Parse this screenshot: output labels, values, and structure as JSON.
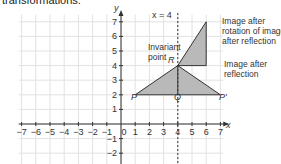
{
  "caption": "transformations.",
  "chart_data": {
    "type": "diagram",
    "title": "",
    "xlabel": "x",
    "ylabel": "y",
    "xlim": [
      -7,
      7
    ],
    "ylim": [
      -3,
      7
    ],
    "x_ticks": [
      "-7",
      "-6",
      "-5",
      "-4",
      "-3",
      "-2",
      "-1",
      "0",
      "1",
      "2",
      "3",
      "4",
      "5",
      "6",
      "7"
    ],
    "y_ticks": [
      "-2",
      "-1",
      "1",
      "2",
      "3",
      "4",
      "5",
      "6",
      "7"
    ],
    "mirror_line": {
      "label": "x = 4",
      "x": 4
    },
    "shapes": [
      {
        "name": "Image after reflection",
        "points": [
          [
            1,
            2
          ],
          [
            4,
            4
          ],
          [
            7,
            2
          ]
        ],
        "note": "triangle PRP' split by QR"
      },
      {
        "name": "Image after rotation of image after reflection",
        "points": [
          [
            4,
            4
          ],
          [
            6,
            7
          ],
          [
            6,
            4
          ]
        ]
      }
    ],
    "points": {
      "P": [
        1,
        2
      ],
      "Q": [
        4,
        2
      ],
      "R": [
        4,
        4
      ],
      "P'": [
        7,
        2
      ]
    },
    "annotations": [
      "Invariant point",
      "Image after rotation of image after reflection",
      "Image after reflection"
    ]
  },
  "labels": {
    "x_axis": "x",
    "y_axis": "y",
    "mirror": "x = 4",
    "P": "P",
    "Q": "Q",
    "R": "R",
    "Pprime": "P'",
    "invariant_1": "Invariant",
    "invariant_2": "point",
    "rot_1": "Image after",
    "rot_2": "rotation of image",
    "rot_3": "after reflection",
    "refl_1": "Image after",
    "refl_2": "reflection"
  }
}
